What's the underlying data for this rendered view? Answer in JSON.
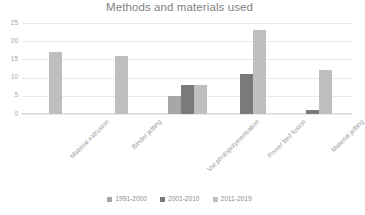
{
  "chart_data": {
    "type": "bar",
    "title": "Methods and materials used",
    "xlabel": "",
    "ylabel": "",
    "ylim": [
      0,
      25
    ],
    "yticks": [
      0,
      5,
      10,
      15,
      20,
      25
    ],
    "grid": true,
    "legend_position": "bottom",
    "categories": [
      "Material extrusion",
      "Binder jetting",
      "Vat photopolymerisation",
      "Power bed fusion",
      "Material jetting"
    ],
    "series": [
      {
        "name": "1991-2000",
        "color": "#a6a6a6",
        "values": [
          0,
          0,
          5,
          0,
          0
        ]
      },
      {
        "name": "2001-2010",
        "color": "#7a7a7a",
        "values": [
          0,
          0,
          8,
          11,
          1
        ]
      },
      {
        "name": "2011-2019",
        "color": "#bfbfbf",
        "values": [
          17,
          16,
          8,
          23,
          12
        ]
      }
    ]
  }
}
